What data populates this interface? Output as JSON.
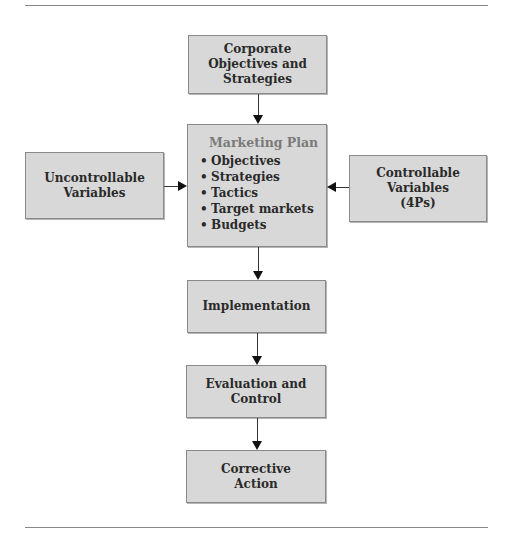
{
  "diagram": {
    "nodes": {
      "corporate": {
        "label": "Corporate\nObjectives and\nStrategies"
      },
      "marketing_plan": {
        "title": "Marketing Plan",
        "bullet": "•",
        "items": [
          "Objectives",
          "Strategies",
          "Tactics",
          "Target markets",
          "Budgets"
        ]
      },
      "uncontrollable": {
        "label": "Uncontrollable\nVariables"
      },
      "controllable": {
        "label": "Controllable\nVariables\n(4Ps)"
      },
      "implementation": {
        "label": "Implementation"
      },
      "evaluation": {
        "label": "Evaluation and\nControl"
      },
      "corrective": {
        "label": "Corrective\nAction"
      }
    },
    "edges": [
      {
        "from": "corporate",
        "to": "marketing_plan"
      },
      {
        "from": "uncontrollable",
        "to": "marketing_plan"
      },
      {
        "from": "controllable",
        "to": "marketing_plan"
      },
      {
        "from": "marketing_plan",
        "to": "implementation"
      },
      {
        "from": "implementation",
        "to": "evaluation"
      },
      {
        "from": "evaluation",
        "to": "corrective"
      }
    ],
    "colors": {
      "box_fill": "#d8d8d8",
      "box_border": "#8a8a8a",
      "heading": "#7a7a7a",
      "arrow": "#111111"
    }
  }
}
